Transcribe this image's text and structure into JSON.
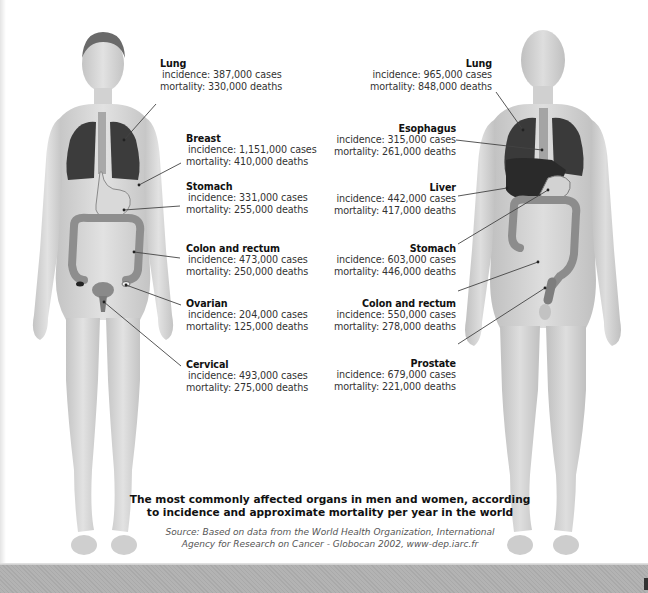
{
  "figure": {
    "caption": {
      "line1": "The most commonly affected organs in men and women, according",
      "line2": "to incidence and approximate mortality per year in the world"
    },
    "source": {
      "line1": "Source: Based on data from the World Health Organization, International",
      "line2": "Agency for Research on Cancer - Globocan 2002, www-dep.iarc.fr"
    },
    "colors": {
      "skin": "#d6d6d6",
      "skin_shade": "#bdbdbd",
      "organ_dark": "#3a3a3a",
      "organ_mid": "#9a9a9a",
      "organ_light": "#cfcfcf",
      "leader_line": "#444444"
    }
  },
  "women": {
    "figure_label": "female-body",
    "organs": [
      {
        "name": "Lung",
        "incidence": "incidence: 387,000 cases",
        "mortality": "mortality: 330,000 deaths"
      },
      {
        "name": "Breast",
        "incidence": "incidence: 1,151,000 cases",
        "mortality": "mortality: 410,000 deaths"
      },
      {
        "name": "Stomach",
        "incidence": "incidence: 331,000 cases",
        "mortality": "mortality: 255,000 deaths"
      },
      {
        "name": "Colon and rectum",
        "incidence": "incidence: 473,000 cases",
        "mortality": "mortality: 250,000 deaths"
      },
      {
        "name": "Ovarian",
        "incidence": "incidence: 204,000 cases",
        "mortality": "mortality: 125,000 deaths"
      },
      {
        "name": "Cervical",
        "incidence": "incidence: 493,000 cases",
        "mortality": "mortality: 275,000 deaths"
      }
    ]
  },
  "men": {
    "figure_label": "male-body",
    "organs": [
      {
        "name": "Lung",
        "incidence": "incidence: 965,000 cases",
        "mortality": "mortality: 848,000 deaths"
      },
      {
        "name": "Esophagus",
        "incidence": "incidence: 315,000 cases",
        "mortality": "mortality: 261,000 deaths"
      },
      {
        "name": "Liver",
        "incidence": "incidence: 442,000 cases",
        "mortality": "mortality: 417,000 deaths"
      },
      {
        "name": "Stomach",
        "incidence": "incidence: 603,000 cases",
        "mortality": "mortality: 446,000 deaths"
      },
      {
        "name": "Colon and rectum",
        "incidence": "incidence: 550,000 cases",
        "mortality": "mortality: 278,000 deaths"
      },
      {
        "name": "Prostate",
        "incidence": "incidence: 679,000 cases",
        "mortality": "mortality: 221,000 deaths"
      }
    ]
  }
}
